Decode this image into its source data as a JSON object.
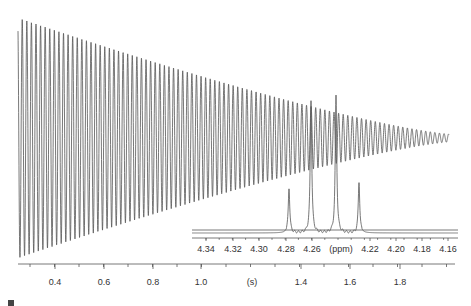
{
  "chart_data": [
    {
      "type": "line",
      "title": "",
      "description": "Free induction decay (FID) — damped oscillation decaying over time",
      "xlabel": "(s)",
      "ylabel": "",
      "xlim": [
        0.27,
        1.98
      ],
      "x_ticks": [
        "0.4",
        "0.6",
        "0.8",
        "1.0",
        "1.4",
        "1.6",
        "1.8"
      ],
      "x_unit_label": "(s)",
      "grid": false,
      "series": [
        {
          "name": "FID",
          "approx_envelope": {
            "t": [
              0.28,
              0.5,
              0.8,
              1.0,
              1.3,
              1.6,
              1.96
            ],
            "amplitude_rel": [
              1.0,
              0.82,
              0.6,
              0.47,
              0.28,
              0.12,
              0.03
            ]
          }
        }
      ]
    },
    {
      "type": "line",
      "title": "",
      "description": "Inset: NMR spectrum quartet",
      "xlabel": "(ppm)",
      "xlim": [
        4.35,
        4.15
      ],
      "x_ticks": [
        "4.34",
        "4.32",
        "4.30",
        "4.28",
        "4.26",
        "4.22",
        "4.20",
        "4.18",
        "4.16"
      ],
      "x_unit_label": "(ppm)",
      "series": [
        {
          "name": "quartet",
          "peaks_ppm": [
            4.275,
            4.258,
            4.237,
            4.219
          ],
          "relative_heights": [
            0.33,
            1.0,
            1.03,
            0.38
          ]
        }
      ]
    }
  ],
  "main_axis": {
    "ticks": [
      {
        "label": "0.4",
        "x": 55
      },
      {
        "label": "0.6",
        "x": 104
      },
      {
        "label": "0.8",
        "x": 153
      },
      {
        "label": "1.0",
        "x": 201
      },
      {
        "label": "(s)",
        "x": 252
      },
      {
        "label": "1.4",
        "x": 301
      },
      {
        "label": "1.6",
        "x": 350
      },
      {
        "label": "1.8",
        "x": 400
      }
    ]
  },
  "inset_axis": {
    "ticks": [
      {
        "label": "4.34",
        "x": 206
      },
      {
        "label": "4.32",
        "x": 233
      },
      {
        "label": "4.30",
        "x": 259
      },
      {
        "label": "4.28",
        "x": 286
      },
      {
        "label": "4.26",
        "x": 312
      },
      {
        "label": "(ppm)",
        "x": 341
      },
      {
        "label": "4.22",
        "x": 370
      },
      {
        "label": "4.20",
        "x": 396
      },
      {
        "label": "4.18",
        "x": 422
      },
      {
        "label": "4.16",
        "x": 448
      }
    ]
  }
}
